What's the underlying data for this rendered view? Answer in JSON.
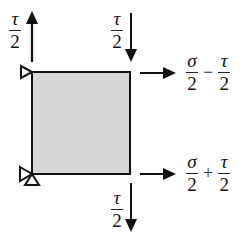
{
  "diagram": {
    "colors": {
      "element_fill": "#d4d4d4",
      "stroke": "#111111",
      "background": "#ffffff"
    },
    "labels": {
      "top_left_shear": {
        "numerator": "τ",
        "denominator": "2",
        "direction": "up"
      },
      "top_right_shear": {
        "numerator": "τ",
        "denominator": "2",
        "direction": "down"
      },
      "bottom_shear": {
        "numerator": "τ",
        "denominator": "2",
        "direction": "down"
      },
      "top_normal": {
        "term1": {
          "numerator": "σ",
          "denominator": "2"
        },
        "operator": "−",
        "term2": {
          "numerator": "τ",
          "denominator": "2"
        },
        "direction": "right"
      },
      "bottom_normal": {
        "term1": {
          "numerator": "σ",
          "denominator": "2"
        },
        "operator": "+",
        "term2": {
          "numerator": "τ",
          "denominator": "2"
        },
        "direction": "right"
      }
    },
    "supports": [
      {
        "name": "top-left-support",
        "shape": "triangle-right"
      },
      {
        "name": "bottom-left-support",
        "shape": "triangle-right-and-up"
      }
    ]
  }
}
